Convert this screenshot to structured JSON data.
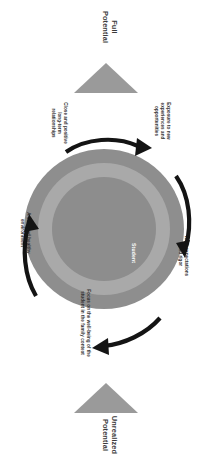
{
  "diagram": {
    "orientation": "rotated-90-ccw",
    "top_marker": {
      "label": "Full\nPotential",
      "shape": "triangle",
      "color": "#9a9a9a"
    },
    "bottom_marker": {
      "label": "Unrealized\nPotential",
      "shape": "triangle",
      "color": "#9a9a9a"
    },
    "rings": [
      {
        "name": "outer",
        "label": "Family Services",
        "color": "#8e8e8e"
      },
      {
        "name": "middle",
        "label": "Academics",
        "color": "#a9a9a9"
      },
      {
        "name": "inner",
        "label": "Student",
        "color": "#8d8d8d"
      }
    ],
    "surrounding_labels": [
      {
        "id": "close-positive",
        "text": "Close and positive long-term relationships"
      },
      {
        "id": "exposure",
        "text": "Exposure to new experiences and opportunities"
      },
      {
        "id": "high-expectations",
        "text": "High expectations and rigor"
      },
      {
        "id": "focus-wellbeing",
        "text": "Focus on the well-being of the student in the family context"
      },
      {
        "id": "safe-healthy",
        "text": "A safe and healthy environment"
      }
    ],
    "arrows": {
      "count": 4,
      "color": "#1a1a1a",
      "names": [
        "arrow-top-left",
        "arrow-top-right",
        "arrow-bottom-right",
        "arrow-bottom-left"
      ]
    }
  },
  "labels": {
    "full_potential": "Full\nPotential",
    "unrealized_potential": "Unrealized\nPotential",
    "family_services": "Family Services",
    "academics": "Academics",
    "student": "Student",
    "close_positive": "Close and positive\nlong-term\nrelationships",
    "exposure": "Exposure to new\nexperiences and\nopportunities",
    "high_expectations": "High expectations\nand rigor",
    "focus_wellbeing": "Focus on the well-being of the\nstudent in the family context",
    "safe_healthy": "A safe and healthy\nenvironment"
  }
}
